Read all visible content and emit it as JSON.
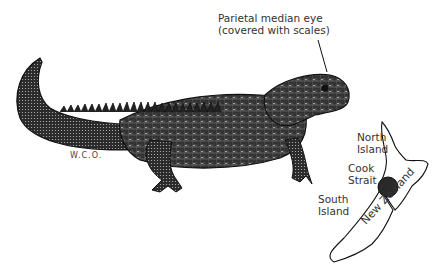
{
  "figure": {
    "annotation": {
      "line1": "Parietal median eye",
      "line2": "(covered with scales)"
    },
    "signature": "W.C.O.",
    "map": {
      "labels": {
        "north_island_1": "North",
        "north_island_2": "Island",
        "cook_strait_1": "Cook",
        "cook_strait_2": "Strait",
        "south_island_1": "South",
        "south_island_2": "Island",
        "country": "New Zealand"
      },
      "highlight_color": "#2a2a2a"
    },
    "ink_color": "#111111"
  }
}
